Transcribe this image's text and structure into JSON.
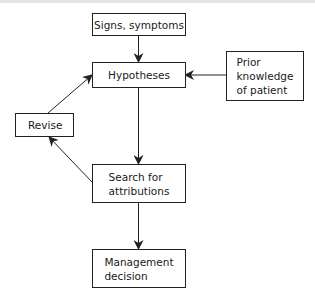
{
  "diagram": {
    "nodes": [
      {
        "id": "signs",
        "label": "Signs, symptoms"
      },
      {
        "id": "hypotheses",
        "label": "Hypotheses"
      },
      {
        "id": "prior",
        "label": "Prior\nknowledge\nof patient"
      },
      {
        "id": "revise",
        "label": "Revise"
      },
      {
        "id": "search",
        "label": "Search for\nattributions"
      },
      {
        "id": "management",
        "label": "Management\ndecision"
      }
    ],
    "edges": [
      {
        "from": "signs",
        "to": "hypotheses"
      },
      {
        "from": "prior",
        "to": "hypotheses"
      },
      {
        "from": "hypotheses",
        "to": "search"
      },
      {
        "from": "search",
        "to": "revise"
      },
      {
        "from": "revise",
        "to": "hypotheses"
      },
      {
        "from": "search",
        "to": "management"
      }
    ],
    "colors": {
      "line": "#222222",
      "background": "#ffffff"
    }
  }
}
